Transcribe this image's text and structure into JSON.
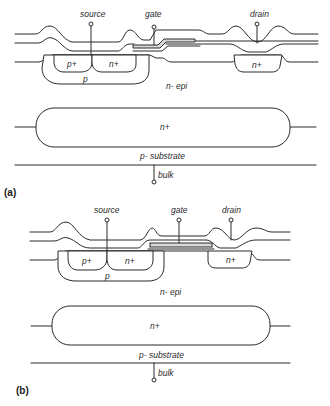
{
  "figure": {
    "panels": [
      {
        "id": "a",
        "caption": "(a)",
        "terminals": {
          "source": "source",
          "gate": "gate",
          "drain": "drain",
          "bulk": "bulk"
        },
        "regions": {
          "p_plus": "p+",
          "n_plus_source": "n+",
          "p_body": "p",
          "n_plus_drain": "n+",
          "n_epi": "n- epi",
          "buried_layer": "n+",
          "substrate": "p- substrate"
        },
        "gate_style": "stepped"
      },
      {
        "id": "b",
        "caption": "(b)",
        "terminals": {
          "source": "source",
          "gate": "gate",
          "drain": "drain",
          "bulk": "bulk"
        },
        "regions": {
          "p_plus": "p+",
          "n_plus_source": "n+",
          "p_body": "p",
          "n_plus_drain": "n+",
          "n_epi": "n- epi",
          "buried_layer": "n+",
          "substrate": "p- substrate"
        },
        "gate_style": "flat"
      }
    ]
  }
}
